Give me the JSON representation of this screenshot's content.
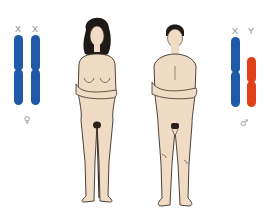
{
  "diagram": {
    "female": {
      "chromosome_labels": [
        "X",
        "X"
      ],
      "symbol": "♀",
      "chromosome_color": "#1f5aa8"
    },
    "male": {
      "chromosome_labels": [
        "X",
        "Y"
      ],
      "symbol": "♂",
      "x_color": "#1f5aa8",
      "y_color": "#e0401a"
    },
    "colors": {
      "skin": "#f0dcc4",
      "outline": "#3a2f28",
      "hair": "#1e1a18",
      "background": "#ffffff"
    }
  }
}
